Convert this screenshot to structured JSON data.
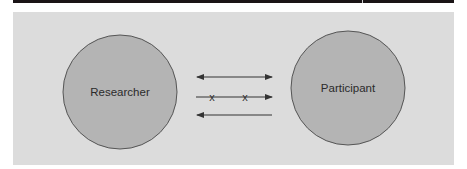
{
  "diagram": {
    "nodes": [
      {
        "id": "researcher",
        "label": "Researcher"
      },
      {
        "id": "participant",
        "label": "Participant"
      }
    ],
    "arrows": [
      {
        "type": "bidirectional",
        "description": "two-way communication"
      },
      {
        "type": "one-way-blocked",
        "direction": "researcher-to-participant",
        "marks": [
          "x",
          "x"
        ]
      },
      {
        "type": "one-way",
        "direction": "participant-to-researcher"
      }
    ],
    "marks": {
      "x1": "x",
      "x2": "x"
    },
    "colors": {
      "panel": "#dcdcdc",
      "circle_fill": "#b4b4b4",
      "circle_stroke": "#555555",
      "arrow": "#333333",
      "top_bar": "#1a1416"
    }
  }
}
